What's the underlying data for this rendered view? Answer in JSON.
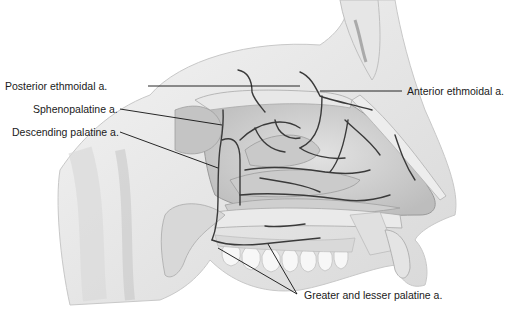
{
  "diagram": {
    "labels": {
      "posterior_ethmoidal": "Posterior ethmoidal a.",
      "sphenopalatine": "Sphenopalatine a.",
      "descending_palatine": "Descending palatine a.",
      "anterior_ethmoidal": "Anterior ethmoidal a.",
      "greater_lesser_palatine": "Greater and lesser palatine a."
    },
    "colors": {
      "background": "#ffffff",
      "tissue_light": "#ececec",
      "tissue_mid": "#d4d4d4",
      "tissue_dark": "#b8b8b8",
      "artery": "#3a3a3a",
      "leader_line": "#111111",
      "label_text": "#1a1a1a"
    }
  }
}
